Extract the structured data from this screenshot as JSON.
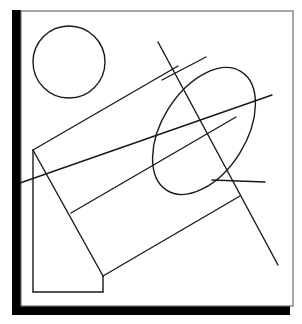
{
  "figure": {
    "title": "Technical line drawing: oblique cylinder with circle and intersecting lines",
    "canvas": {
      "width": 302,
      "height": 324,
      "background": "#ffffff"
    },
    "colors": {
      "ink": "#1a1a1a",
      "shadow": "#000000",
      "frame": "#6e6e6e",
      "paper": "#ffffff"
    },
    "stroke_widths": {
      "frame": 1.2,
      "outline": 1.4,
      "line": 1.4
    },
    "shadow": {
      "name": "drop-shadow-offset-block",
      "left_bar": {
        "x": 12,
        "y": 10,
        "width": 9,
        "height": 305
      },
      "bottom_bar": {
        "x": 12,
        "y": 306,
        "width": 278,
        "height": 9
      }
    },
    "frame": {
      "name": "paper-frame-rectangle",
      "x": 21,
      "y": 11,
      "width": 272,
      "height": 295
    },
    "circle": {
      "name": "free-circle",
      "cx": 69,
      "cy": 62,
      "r": 36
    },
    "ellipse": {
      "name": "cylinder-end-ellipse",
      "cx": 204,
      "cy": 131,
      "rx": 42,
      "ry": 70,
      "rotation_deg": 32
    },
    "polylines": [
      {
        "name": "cylinder-body-upper-edge",
        "points": "33,150 178,66"
      },
      {
        "name": "cylinder-body-lower-edge",
        "points": "103,276 240,196"
      },
      {
        "name": "left-face-vertical-edge",
        "points": "33,150 33,292"
      },
      {
        "name": "left-face-bottom-edge",
        "points": "33,292 103,292"
      },
      {
        "name": "left-face-right-edge",
        "points": "103,292 103,276"
      },
      {
        "name": "left-face-diagonal-edge",
        "points": "33,150 103,276"
      },
      {
        "name": "mid-fold-edge",
        "points": "71,213 236,117"
      }
    ],
    "lines": [
      {
        "name": "secant-line-shallow-upper",
        "x1": 162,
        "y1": 80,
        "x2": 206,
        "y2": 57
      },
      {
        "name": "secant-line-steep-long",
        "x1": 158,
        "y1": 42,
        "x2": 278,
        "y2": 265
      },
      {
        "name": "secant-line-shallow-lower",
        "x1": 20,
        "y1": 183,
        "x2": 272,
        "y2": 95
      },
      {
        "name": "secant-line-right-short",
        "x1": 212,
        "y1": 180,
        "x2": 265,
        "y2": 182
      }
    ]
  }
}
